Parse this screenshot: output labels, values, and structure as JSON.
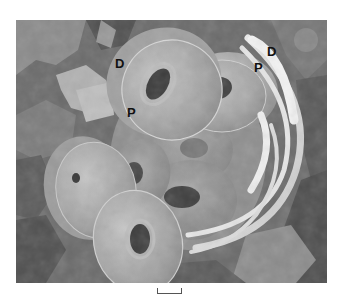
{
  "figure": {
    "type": "SEM micrograph",
    "colors": {
      "background_dark": "#4a4a4a",
      "background_mid": "#7a7a7a",
      "coccolith_face": "#a9a9a9",
      "coccolith_rim": "#cfcfcf",
      "edge_on_arcs": "#e8e8e8",
      "hole": "#3c3c3c"
    }
  },
  "labels": [
    {
      "id": "D-left",
      "text": "D",
      "x": 115,
      "y": 57
    },
    {
      "id": "P-left",
      "text": "P",
      "x": 127,
      "y": 106
    },
    {
      "id": "D-right",
      "text": "D",
      "x": 267,
      "y": 45
    },
    {
      "id": "P-right",
      "text": "P",
      "x": 254,
      "y": 61
    }
  ],
  "scale_bar": {
    "label": ""
  }
}
